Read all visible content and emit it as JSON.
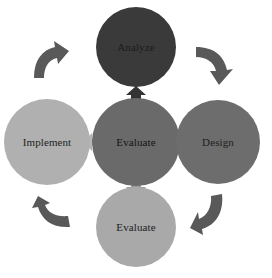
{
  "diagram": {
    "type": "cycle-with-hub",
    "center": {
      "label": "Evaluate",
      "color": "#6a6a6a"
    },
    "nodes": {
      "top": {
        "label": "Analyze",
        "color": "#3a3a3a"
      },
      "right": {
        "label": "Design",
        "color": "#6d6d6d"
      },
      "bottom": {
        "label": "Evaluate",
        "color": "#a9a9a9"
      },
      "left": {
        "label": "Implement",
        "color": "#b0b0b0"
      }
    },
    "hub_arrows": {
      "up": {
        "color": "#333333"
      },
      "right": {
        "color": "#707070"
      },
      "down": {
        "color": "#9a9a9a"
      },
      "left": {
        "color": "#b5b5b5"
      }
    },
    "cycle_arrows": {
      "top_left": {
        "direction": "clockwise",
        "color": "#5a5a5a"
      },
      "top_right": {
        "direction": "clockwise",
        "color": "#5a5a5a"
      },
      "bottom_right": {
        "direction": "clockwise",
        "color": "#5a5a5a"
      },
      "bottom_left": {
        "direction": "clockwise",
        "color": "#5a5a5a"
      }
    }
  }
}
